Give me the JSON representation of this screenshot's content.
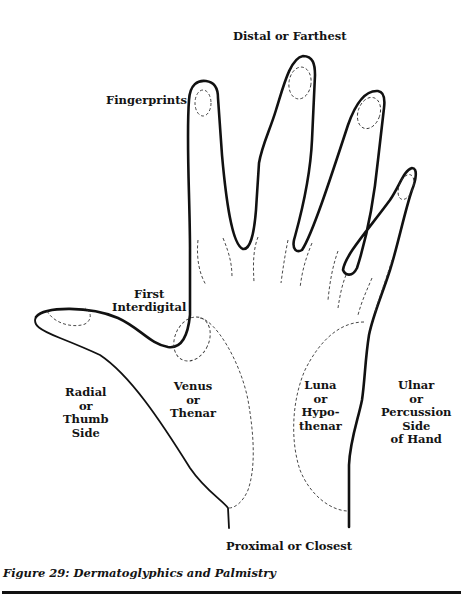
{
  "figure": {
    "caption": "Figure 29: Dermatoglyphics and Palmistry",
    "labels": {
      "distal": "Distal or Farthest",
      "fingerprints": "Fingerprints",
      "first_interdigital": [
        "First",
        "Interdigital"
      ],
      "radial": [
        "Radial",
        "or",
        "Thumb",
        "Side"
      ],
      "venus": [
        "Venus",
        "or",
        "Thenar"
      ],
      "luna": [
        "Luna",
        "or",
        "Hypo-",
        "thenar"
      ],
      "ulnar": [
        "Ulnar",
        "or",
        "Percussion",
        "Side",
        "of Hand"
      ],
      "proximal": "Proximal or Closest"
    },
    "colors": {
      "line": "#111111",
      "background": "#ffffff"
    }
  }
}
